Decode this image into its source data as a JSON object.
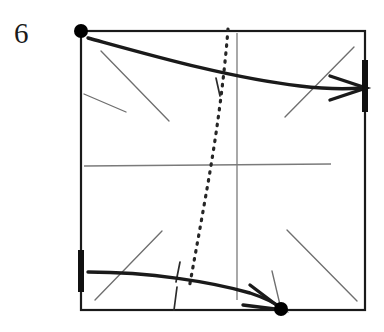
{
  "figure": {
    "label": "6",
    "label_position": {
      "x": 14,
      "y": 19
    },
    "caption": "",
    "type": "origami-fold-step-diagram",
    "canvas": {
      "width": 384,
      "height": 332
    },
    "colors": {
      "ink": "#1a1a1a",
      "thin_line": "#6b6b6b",
      "background": "#ffffff",
      "dot": "#000000",
      "dotted_fold": "#262626"
    },
    "square": {
      "name": "paper-outline",
      "left": 81,
      "top": 31,
      "right": 365,
      "bottom": 310,
      "stroke_width": 2.2
    },
    "dots": [
      {
        "name": "corner-dot-top-left",
        "x": 81,
        "y": 31,
        "r": 7
      },
      {
        "name": "corner-dot-bottom",
        "x": 281,
        "y": 309,
        "r": 7
      }
    ],
    "edge_ticks": [
      {
        "name": "tick-right-edge",
        "x1": 365,
        "y1": 60,
        "x2": 365,
        "y2": 112,
        "width": 6
      },
      {
        "name": "tick-left-edge",
        "x1": 81,
        "y1": 250,
        "x2": 81,
        "y2": 292,
        "width": 6
      }
    ],
    "dotted_fold_line": {
      "name": "dotted-fold-line",
      "points": [
        [
          228,
          29
        ],
        [
          222,
          80
        ],
        [
          214,
          140
        ],
        [
          205,
          200
        ],
        [
          196,
          252
        ],
        [
          189,
          288
        ]
      ],
      "dash": "1.5 6.5",
      "stroke_width": 3.2
    },
    "thin_vertical_line": {
      "name": "thin-vertical-crease",
      "x1": 237,
      "y1": 33,
      "x2": 237,
      "y2": 300
    },
    "thin_horizontal_line": {
      "name": "thin-horizontal-crease",
      "x1": 84,
      "y1": 166,
      "x2": 331,
      "y2": 164
    },
    "thin_construction_lines": [
      {
        "name": "thin-line-tl-long",
        "x1": 101,
        "y1": 51,
        "x2": 169,
        "y2": 121
      },
      {
        "name": "thin-line-tl-short",
        "x1": 84,
        "y1": 94,
        "x2": 126,
        "y2": 112
      },
      {
        "name": "thin-line-tr-diagonal",
        "x1": 285,
        "y1": 117,
        "x2": 354,
        "y2": 47
      },
      {
        "name": "thin-line-bl-diagonal",
        "x1": 95,
        "y1": 300,
        "x2": 162,
        "y2": 231
      },
      {
        "name": "thin-line-br-diagonal",
        "x1": 287,
        "y1": 230,
        "x2": 357,
        "y2": 301
      },
      {
        "name": "thin-line-dot-stem",
        "x1": 281,
        "y1": 309,
        "x2": 272,
        "y2": 271
      },
      {
        "name": "thin-tick-cross-upper-curve",
        "x1": 216,
        "y1": 78,
        "x2": 220,
        "y2": 96
      },
      {
        "name": "thin-tick-cross-lower-curve",
        "x1": 180,
        "y1": 262,
        "x2": 176,
        "y2": 282
      },
      {
        "name": "thin-tick-bottom-edge",
        "x1": 177,
        "y1": 287,
        "x2": 174,
        "y2": 310
      }
    ],
    "arrows": [
      {
        "name": "fold-arrow-upper",
        "direction": "right",
        "curve": [
          [
            88,
            38
          ],
          [
            170,
            62
          ],
          [
            240,
            80
          ],
          [
            300,
            86
          ],
          [
            352,
            88
          ]
        ],
        "head": {
          "tip_x": 366,
          "tip_y": 88,
          "back_x": 330,
          "back_y": 76,
          "back2_x": 330,
          "back2_y": 100
        },
        "stroke_width": 3.4
      },
      {
        "name": "fold-arrow-lower",
        "direction": "right-down",
        "curve": [
          [
            88,
            272
          ],
          [
            150,
            274
          ],
          [
            210,
            282
          ],
          [
            250,
            292
          ],
          [
            272,
            303
          ]
        ],
        "head": {
          "tip_x": 283,
          "tip_y": 310,
          "back_x": 250,
          "back_y": 285,
          "back2_x": 243,
          "back2_y": 305
        },
        "stroke_width": 3.4
      }
    ]
  }
}
